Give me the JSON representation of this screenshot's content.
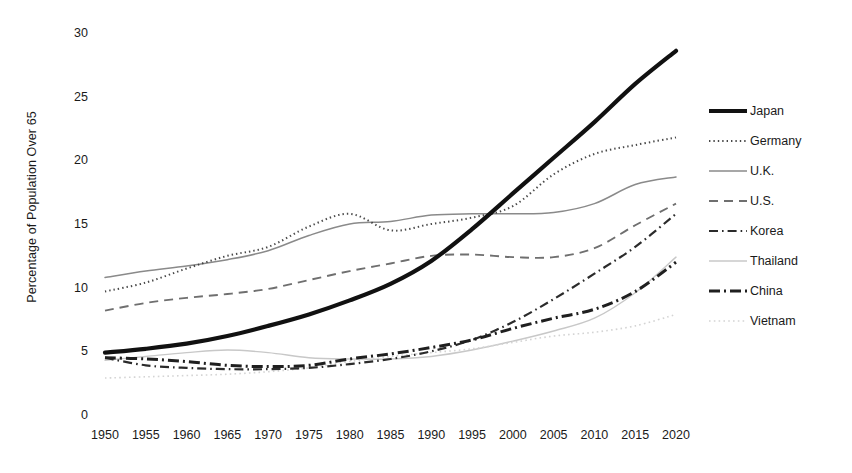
{
  "chart_data": {
    "type": "line",
    "title": "",
    "xlabel": "",
    "ylabel": "Percentage of Population Over 65",
    "xlim": [
      1950,
      2020
    ],
    "ylim": [
      0,
      30
    ],
    "grid": false,
    "legend_position": "right",
    "x": [
      1950,
      1955,
      1960,
      1965,
      1970,
      1975,
      1980,
      1985,
      1990,
      1995,
      2000,
      2005,
      2010,
      2015,
      2020
    ],
    "xtick_labels": [
      "1950",
      "1955",
      "1960",
      "1965",
      "1970",
      "1975",
      "1980",
      "1985",
      "1990",
      "1995",
      "2000",
      "2005",
      "2010",
      "2015",
      "2020"
    ],
    "ytick_labels": [
      "0",
      "5",
      "10",
      "15",
      "20",
      "25",
      "30"
    ],
    "ytick_values": [
      0,
      5,
      10,
      15,
      20,
      25,
      30
    ],
    "series": [
      {
        "name": "Japan",
        "style": "solid-thick-black",
        "color": "#111111",
        "values": [
          4.9,
          5.2,
          5.6,
          6.2,
          7.0,
          7.9,
          9.0,
          10.3,
          12.1,
          14.6,
          17.4,
          20.2,
          23.0,
          26.0,
          28.6
        ]
      },
      {
        "name": "Germany",
        "style": "dotted",
        "color": "#3a3a3a",
        "values": [
          9.7,
          10.4,
          11.5,
          12.5,
          13.2,
          14.8,
          15.8,
          14.5,
          15.0,
          15.5,
          16.4,
          18.9,
          20.5,
          21.2,
          21.8
        ]
      },
      {
        "name": "U.K.",
        "style": "solid-thin-gray",
        "color": "#8a8a8a",
        "values": [
          10.8,
          11.3,
          11.7,
          12.2,
          12.9,
          14.1,
          15.0,
          15.2,
          15.7,
          15.8,
          15.8,
          15.9,
          16.6,
          18.1,
          18.7
        ]
      },
      {
        "name": "U.S.",
        "style": "dashed",
        "color": "#6f6f6f",
        "values": [
          8.2,
          8.8,
          9.2,
          9.5,
          9.9,
          10.6,
          11.3,
          11.9,
          12.5,
          12.6,
          12.4,
          12.4,
          13.1,
          14.9,
          16.6
        ]
      },
      {
        "name": "Korea",
        "style": "dash-dot-thin",
        "color": "#2b2b2b",
        "values": [
          4.5,
          3.9,
          3.7,
          3.6,
          3.6,
          3.7,
          4.0,
          4.4,
          5.0,
          5.9,
          7.3,
          9.1,
          11.1,
          13.2,
          15.8
        ]
      },
      {
        "name": "Thailand",
        "style": "solid-very-light",
        "color": "#c8c8c8",
        "values": [
          4.3,
          4.6,
          4.9,
          5.1,
          4.9,
          4.5,
          4.4,
          4.4,
          4.6,
          5.1,
          5.8,
          6.6,
          7.6,
          9.6,
          12.4
        ]
      },
      {
        "name": "China",
        "style": "dash-dot-thick",
        "color": "#1f1f1f",
        "values": [
          4.5,
          4.4,
          4.2,
          3.9,
          3.8,
          3.9,
          4.4,
          4.8,
          5.3,
          5.9,
          6.8,
          7.6,
          8.3,
          9.7,
          12.0
        ]
      },
      {
        "name": "Vietnam",
        "style": "dotted-very-light",
        "color": "#d4d4d4",
        "values": [
          2.9,
          3.0,
          3.1,
          3.2,
          3.4,
          3.7,
          4.2,
          4.6,
          4.9,
          5.2,
          5.7,
          6.2,
          6.5,
          7.0,
          7.9
        ]
      }
    ]
  },
  "axis": {
    "y_title": "Percentage of Population Over 65"
  },
  "legend": {
    "items": [
      {
        "label": "Japan"
      },
      {
        "label": "Germany"
      },
      {
        "label": "U.K."
      },
      {
        "label": "U.S."
      },
      {
        "label": "Korea"
      },
      {
        "label": "Thailand"
      },
      {
        "label": "China"
      },
      {
        "label": "Vietnam"
      }
    ]
  }
}
